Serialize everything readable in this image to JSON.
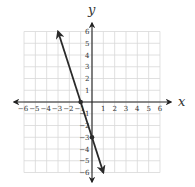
{
  "chart_data": {
    "type": "line",
    "title": "",
    "xlabel": "x",
    "ylabel": "y",
    "xlim": [
      -6,
      6
    ],
    "ylim": [
      -6,
      6
    ],
    "grid": true,
    "x_ticks": [
      -6,
      -5,
      -4,
      -3,
      -2,
      -1,
      1,
      2,
      3,
      4,
      5,
      6
    ],
    "y_ticks": [
      -6,
      -5,
      -4,
      -3,
      -2,
      -1,
      1,
      2,
      3,
      4,
      5,
      6
    ],
    "series": [
      {
        "name": "y = -3x - 3",
        "slope": -3,
        "intercept": -3,
        "x": [
          -3,
          1
        ],
        "y": [
          6,
          -6
        ],
        "arrows_both_ends": true,
        "marked_points": [
          {
            "x": -1,
            "y": 0
          },
          {
            "x": 0,
            "y": -3
          }
        ]
      }
    ]
  },
  "labels": {
    "x_axis": "x",
    "y_axis": "y"
  },
  "colors": {
    "grid": "#d8d8d8",
    "axis": "#222222",
    "line": "#2a2a2a"
  }
}
